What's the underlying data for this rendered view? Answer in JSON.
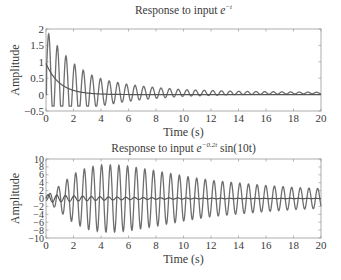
{
  "chart_data": [
    {
      "type": "line",
      "title": "Response to input e^{-t}",
      "title_parts": {
        "prefix": "Response to input ",
        "base": "e",
        "sup": "−t",
        "suffix": ""
      },
      "xlabel": "Time (s)",
      "ylabel": "Amplitude",
      "xlim": [
        0,
        20
      ],
      "ylim": [
        -0.5,
        2
      ],
      "xticks": [
        0,
        2,
        4,
        6,
        8,
        10,
        12,
        14,
        16,
        18,
        20
      ],
      "xtick_labels": [
        "0",
        "2",
        "4",
        "6",
        "8",
        "10",
        "12",
        "14",
        "16",
        "18",
        "20"
      ],
      "yticks": [
        -0.5,
        0,
        0.5,
        1,
        1.5,
        2
      ],
      "ytick_labels": [
        "−0.5",
        "0",
        "0.5",
        "1",
        "1.5",
        "2"
      ],
      "grid": false,
      "series": [
        {
          "name": "input",
          "description": "decaying exponential e^{-t}",
          "x": [
            0,
            0.5,
            1,
            1.5,
            2,
            3,
            4,
            6,
            10,
            20
          ],
          "values": [
            0.95,
            0.58,
            0.35,
            0.21,
            0.13,
            0.05,
            0.02,
            0.0,
            0.0,
            0.0
          ]
        },
        {
          "name": "output",
          "description": "oscillating response, omega ~10 rad/s, decaying to ~0.05",
          "peaks_x": [
            0.2,
            0.8,
            1.4,
            2.0,
            2.7,
            3.3,
            3.9,
            4.6,
            5.2,
            5.8,
            7.1,
            8.4,
            10,
            14,
            20
          ],
          "peaks_y": [
            1.85,
            1.5,
            1.2,
            0.95,
            0.75,
            0.6,
            0.5,
            0.42,
            0.37,
            0.32,
            0.25,
            0.2,
            0.15,
            0.1,
            0.07
          ],
          "troughs_y_min": -0.35,
          "final_value": 0.05
        }
      ]
    },
    {
      "type": "line",
      "title": "Response to input e^{-0.2t} sin(10t)",
      "title_parts": {
        "prefix": "Response to input ",
        "base": "e",
        "sup": "−0.2t",
        "suffix": " sin(10t)"
      },
      "xlabel": "Time (s)",
      "ylabel": "Amplitude",
      "xlim": [
        0,
        20
      ],
      "ylim": [
        -10,
        10
      ],
      "xticks": [
        0,
        2,
        4,
        6,
        8,
        10,
        12,
        14,
        16,
        18,
        20
      ],
      "xtick_labels": [
        "0",
        "2",
        "4",
        "6",
        "8",
        "10",
        "12",
        "14",
        "16",
        "18",
        "20"
      ],
      "yticks": [
        -10,
        -8,
        -6,
        -4,
        -2,
        0,
        2,
        4,
        6,
        8,
        10
      ],
      "ytick_labels": [
        "−10",
        "−8",
        "−6",
        "−4",
        "−2",
        "0",
        "2",
        "4",
        "6",
        "8",
        "10"
      ],
      "grid": false,
      "series": [
        {
          "name": "input",
          "description": "e^{-0.2t} sin(10t), amplitude <= 1",
          "envelope_x": [
            0,
            2,
            5,
            10,
            20
          ],
          "envelope_y": [
            1,
            0.67,
            0.37,
            0.14,
            0.02
          ]
        },
        {
          "name": "output",
          "description": "resonant response, envelope grows then decays",
          "envelope_x": [
            0,
            1,
            2,
            3,
            4,
            5,
            6,
            8,
            10,
            12,
            14,
            16,
            18,
            20
          ],
          "envelope_y": [
            0.5,
            3.3,
            6.2,
            7.8,
            8.5,
            8.5,
            8.2,
            7.0,
            5.7,
            4.6,
            3.9,
            3.3,
            2.8,
            2.5
          ]
        }
      ]
    }
  ]
}
